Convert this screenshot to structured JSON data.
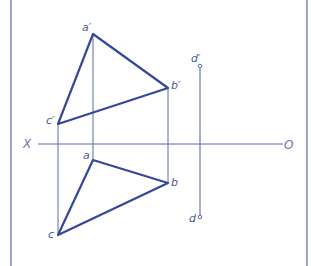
{
  "diagram": {
    "type": "orthographic-projection",
    "colors": {
      "triangle": "#34489a",
      "projector": "#5a6aa8",
      "axis": "#5a6aa8",
      "border": "#5a6aa8",
      "label": "#4a5a9a"
    },
    "axis": {
      "left_label": "X",
      "right_label": "O"
    },
    "points": {
      "a_prime": {
        "label": "a′",
        "x": 93,
        "y": 34
      },
      "b_prime": {
        "label": "b′",
        "x": 168,
        "y": 88
      },
      "c_prime": {
        "label": "c′",
        "x": 58,
        "y": 124
      },
      "d_prime": {
        "label": "d′",
        "x": 200,
        "y": 66
      },
      "a": {
        "label": "a",
        "x": 93,
        "y": 160
      },
      "b": {
        "label": "b",
        "x": 168,
        "y": 183
      },
      "c": {
        "label": "c",
        "x": 58,
        "y": 235
      },
      "d": {
        "label": "d",
        "x": 200,
        "y": 217
      }
    },
    "front_view_triangle": [
      "a′",
      "b′",
      "c′"
    ],
    "top_view_triangle": [
      "a",
      "b",
      "c"
    ],
    "line_segment": [
      "d′",
      "d"
    ]
  }
}
